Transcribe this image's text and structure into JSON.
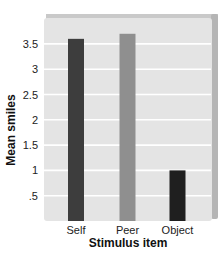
{
  "chart_data": {
    "type": "bar",
    "title": "",
    "xlabel": "Stimulus item",
    "ylabel": "Mean smiles",
    "categories": [
      "Self",
      "Peer",
      "Object"
    ],
    "values": [
      3.6,
      3.7,
      1.0
    ],
    "bar_colors": [
      "#3d3d3d",
      "#8f8f8f",
      "#1f1f1f"
    ],
    "yticks": [
      ".5",
      "1",
      "1.5",
      "2",
      "2.5",
      "3",
      "3.5"
    ],
    "ytick_values": [
      0.5,
      1,
      1.5,
      2,
      2.5,
      3,
      3.5
    ],
    "ylim": [
      0,
      4.0
    ],
    "grid": true,
    "legend": null
  },
  "colors": {
    "panel_background": "#e4e4e4",
    "gridline": "#ffffff",
    "panel_shadow": "#b5b5b5"
  }
}
